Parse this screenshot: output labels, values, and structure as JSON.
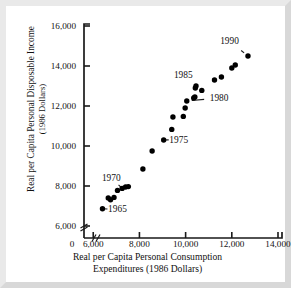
{
  "chart_data": {
    "type": "scatter",
    "title": "",
    "xlabel": "Real per Capita Personal Consumption Expenditures (1986 Dollars)",
    "xlabel_line1": "Real per Capita Personal Consumption",
    "xlabel_line2": "Expenditures (1986 Dollars)",
    "ylabel": "Real per Capita Personal Disposable Income (1986 Dollars)",
    "ylabel_line1": "Real per Capita Personal Disposable Income",
    "ylabel_line2": "(1986 Dollars)",
    "xlim": [
      5600,
      14000
    ],
    "ylim": [
      5400,
      16000
    ],
    "xticks": [
      6000,
      8000,
      10000,
      12000,
      14000
    ],
    "xtick_labels": [
      "6,000",
      "8,000",
      "10,000",
      "12,000",
      "14,000"
    ],
    "origin_label": "0",
    "yticks": [
      6000,
      8000,
      10000,
      12000,
      14000,
      16000
    ],
    "ytick_labels": [
      "6,000",
      "8,000",
      "10,000",
      "12,000",
      "14,000",
      "16,000"
    ],
    "grid": false,
    "legend": "none",
    "axis_break_x": true,
    "axis_break_y": true,
    "point_color": "#000000",
    "axis_color": "#1a1a1a",
    "background_color": "#ffffff",
    "frame_color": "#e9e9e9",
    "series": [
      {
        "name": "Income vs Consumption",
        "x": [
          6400,
          6650,
          6750,
          6900,
          7050,
          7250,
          7400,
          7520,
          8150,
          8550,
          9050,
          9400,
          9450,
          9900,
          9980,
          10050,
          10350,
          10400,
          10420,
          10450,
          10700,
          11250,
          11550,
          12000,
          12150,
          12700
        ],
        "y": [
          6860,
          7400,
          7310,
          7430,
          7780,
          7880,
          7950,
          7970,
          8850,
          9750,
          10300,
          10830,
          11450,
          11480,
          11900,
          12250,
          12400,
          12450,
          12900,
          13000,
          12780,
          13300,
          13450,
          13900,
          14050,
          14500
        ],
        "labels": [
          "1965",
          "1966",
          "1967",
          "1968",
          "1969",
          "1970",
          "1971",
          "1972",
          "1973",
          "1974",
          "1975",
          "1976",
          "1977",
          "1978",
          "1979",
          "1980",
          "1981",
          "1982",
          "1983",
          "1984",
          "1985",
          "1986",
          "1987",
          "1988",
          "1989",
          "1990"
        ]
      }
    ],
    "annotations": [
      {
        "text": "1965",
        "label_x": 7050,
        "label_y": 6830,
        "point_x": 6400,
        "point_y": 6860
      },
      {
        "text": "1970",
        "label_x": 6780,
        "label_y": 8420,
        "point_x": 7250,
        "point_y": 7880
      },
      {
        "text": "1975",
        "label_x": 9700,
        "label_y": 10320,
        "point_x": 9050,
        "point_y": 10300
      },
      {
        "text": "1980",
        "label_x": 11450,
        "label_y": 12400,
        "point_x": 10050,
        "point_y": 12250
      },
      {
        "text": "1985",
        "label_x": 9900,
        "label_y": 13550,
        "point_x": 10700,
        "point_y": 12780
      },
      {
        "text": "1990",
        "label_x": 11900,
        "label_y": 15250,
        "point_x": 12700,
        "point_y": 14500
      }
    ]
  }
}
